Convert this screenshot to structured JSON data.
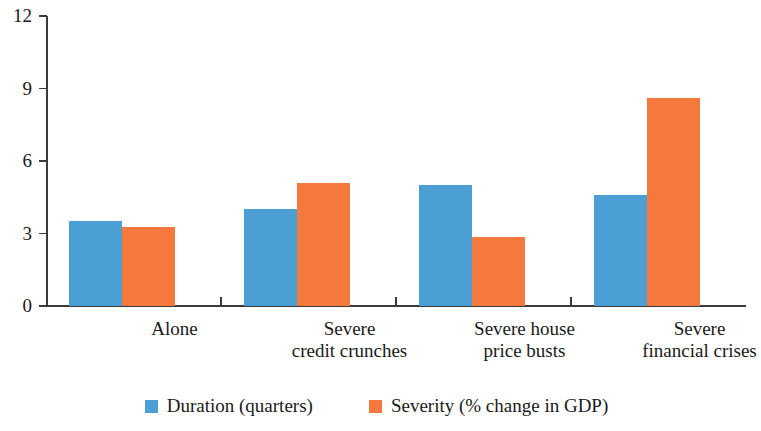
{
  "chart_data": {
    "type": "bar",
    "title": "",
    "subtitle": "",
    "xlabel": "",
    "ylabel": "",
    "ylim": [
      0,
      12
    ],
    "yticks": [
      0,
      3,
      6,
      9,
      12
    ],
    "ytick_labels": [
      "0",
      "3",
      "6",
      "9",
      "12"
    ],
    "grid": false,
    "legend_position": "bottom",
    "categories": [
      "Alone",
      "Severe\ncredit crunches",
      "Severe house\nprice busts",
      "Severe\nfinancial crises"
    ],
    "category_lines": [
      [
        "Alone"
      ],
      [
        "Severe",
        "credit crunches"
      ],
      [
        "Severe house",
        "price busts"
      ],
      [
        "Severe",
        "financial crises"
      ]
    ],
    "series": [
      {
        "name": "Duration (quarters)",
        "color": "#4C9FD4",
        "values": [
          3.5,
          4.0,
          5.0,
          4.6
        ]
      },
      {
        "name": "Severity (% change in GDP)",
        "color": "#F5783C",
        "values": [
          3.25,
          5.1,
          2.85,
          8.6
        ]
      }
    ]
  },
  "legend": {
    "items": [
      {
        "label": "Duration (quarters)",
        "color": "#4C9FD4"
      },
      {
        "label": "Severity (% change in GDP)",
        "color": "#F5783C"
      }
    ]
  },
  "colors": {
    "duration": "#4C9FD4",
    "severity": "#F5783C",
    "axis": "#3a3a3a",
    "text": "#1a1a1a",
    "background": "#ffffff"
  }
}
